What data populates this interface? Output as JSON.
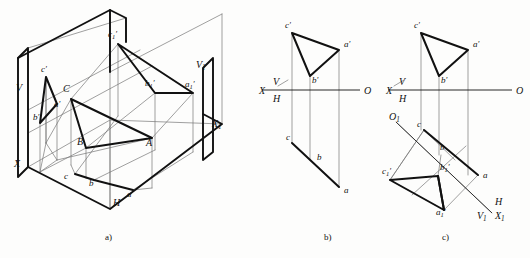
{
  "figure": {
    "background_color": "#fdfdfc",
    "ink_color": "#111111",
    "thick_line_color": "#111111",
    "thin_line_color": "#777777",
    "captions": [
      {
        "key": "a",
        "text": "a)",
        "x": 105,
        "y": 240
      },
      {
        "key": "b",
        "text": "b)",
        "x": 324,
        "y": 240
      },
      {
        "key": "c",
        "text": "c)",
        "x": 442,
        "y": 240
      }
    ]
  },
  "panel_a": {
    "name": "pictorial-3d-projection-box",
    "labels": [
      {
        "name": "label-V",
        "text": "V",
        "x": 16,
        "y": 91,
        "italic": true,
        "size": 10
      },
      {
        "name": "label-X",
        "text": "X",
        "x": 14,
        "y": 167,
        "italic": true,
        "size": 10
      },
      {
        "name": "label-H",
        "text": "H",
        "x": 113,
        "y": 206,
        "italic": true,
        "size": 10
      },
      {
        "name": "label-V1",
        "text": "V",
        "sub": "1",
        "x": 196,
        "y": 68,
        "italic": true,
        "size": 10
      },
      {
        "name": "label-X1",
        "text": "X",
        "sub": "1",
        "x": 212,
        "y": 127,
        "italic": true,
        "size": 10
      },
      {
        "name": "label-c-prime",
        "text": "c",
        "prime": true,
        "x": 41,
        "y": 72,
        "italic": true,
        "size": 9
      },
      {
        "name": "label-a-prime",
        "text": "a",
        "prime": true,
        "x": 54,
        "y": 107,
        "italic": true,
        "size": 9
      },
      {
        "name": "label-b-prime",
        "text": "b",
        "prime": true,
        "x": 33,
        "y": 120,
        "italic": true,
        "size": 9
      },
      {
        "name": "label-C",
        "text": "C",
        "x": 63,
        "y": 92,
        "italic": true,
        "size": 10
      },
      {
        "name": "label-B",
        "text": "B",
        "x": 77,
        "y": 145,
        "italic": true,
        "size": 10
      },
      {
        "name": "label-A",
        "text": "A",
        "x": 146,
        "y": 146,
        "italic": true,
        "size": 10
      },
      {
        "name": "label-c",
        "text": "c",
        "x": 64,
        "y": 179,
        "italic": true,
        "size": 9
      },
      {
        "name": "label-b",
        "text": "b",
        "x": 89,
        "y": 186,
        "italic": true,
        "size": 9
      },
      {
        "name": "label-a",
        "text": "a",
        "x": 127,
        "y": 197,
        "italic": true,
        "size": 9
      },
      {
        "name": "label-c1-prime",
        "text": "c",
        "sub": "1",
        "prime": true,
        "x": 108,
        "y": 37,
        "italic": true,
        "size": 9
      },
      {
        "name": "label-b1-prime",
        "text": "b",
        "sub": "1",
        "prime": true,
        "x": 145,
        "y": 86,
        "italic": true,
        "size": 9
      },
      {
        "name": "label-a1-prime",
        "text": "a",
        "sub": "1",
        "prime": true,
        "x": 185,
        "y": 87,
        "italic": true,
        "size": 9
      }
    ],
    "thick_paths": [
      "M 18 58 L 28 48 L 28 167 L 18 177 Z",
      "M 18 58 L 110 10 L 110 72",
      "M 110 10 L 126 18 L 126 42",
      "M 28 167 L 110 209 L 222 124 L 203 114",
      "M 203 68 L 203 160 L 213 152 L 213 58 Z"
    ],
    "thick_polylines": [
      {
        "name": "triangle-VH-projection",
        "points": "46,77 40,123 57,104 46,77"
      },
      {
        "name": "triangle-ABC-space",
        "points": "71,99 86,148 152,138 71,99"
      },
      {
        "name": "triangle-abc-horizontal",
        "points": "75,174 94,180 133,190"
      },
      {
        "name": "triangle-V1-projection",
        "points": "118,44 155,93 193,93 118,44"
      }
    ],
    "thin_lines": [
      "M 28 48 L 126 18",
      "M 28 48 L 28 167",
      "M 110 72 L 110 209",
      "M 110 72 L 222 14",
      "M 126 18 L 126 42",
      "M 222 14 L 222 124",
      "M 110 10 L 110 72",
      "M 46 77 L 46 143",
      "M 40 123 L 40 172",
      "M 57 104 L 57 160",
      "M 71 99 L 71 165",
      "M 86 148 L 86 178",
      "M 152 138 L 152 188",
      "M 118 44 L 118 116",
      "M 155 93 L 155 150",
      "M 193 93 L 193 152",
      "M 46 143 L 71 99",
      "M 40 172 L 86 148",
      "M 57 160 L 152 138",
      "M 71 165 L 75 174",
      "M 86 178 L 94 180",
      "M 152 188 L 133 190",
      "M 28 110 L 140 50",
      "M 28 133 L 152 66",
      "M 46 143 L 46 77",
      "M 75 174 L 118 116",
      "M 94 180 L 155 150",
      "M 133 190 L 193 152",
      "M 71 99 L 118 44",
      "M 86 148 L 155 93",
      "M 152 138 L 193 93",
      "M 28 167 L 110 120 L 222 124",
      "M 110 120 L 110 209",
      "M 46 143 L 40 172",
      "M 46 143 L 57 160",
      "M 40 172 L 57 160"
    ]
  },
  "panel_b": {
    "name": "two-view-orthographic-projection",
    "axis": {
      "name": "XO-ground-line",
      "x1": 262,
      "y1": 90,
      "x2": 360,
      "y2": 90
    },
    "labels": [
      {
        "name": "label-X",
        "text": "X",
        "x": 259,
        "y": 94,
        "italic": true,
        "size": 10
      },
      {
        "name": "label-V",
        "text": "V",
        "x": 273,
        "y": 85,
        "italic": true,
        "size": 10
      },
      {
        "name": "label-H",
        "text": "H",
        "x": 273,
        "y": 102,
        "italic": true,
        "size": 10
      },
      {
        "name": "label-O",
        "text": "O",
        "x": 364,
        "y": 94,
        "italic": true,
        "size": 10
      },
      {
        "name": "label-c-prime",
        "text": "c",
        "prime": true,
        "x": 285,
        "y": 28,
        "italic": true,
        "size": 9
      },
      {
        "name": "label-a-prime",
        "text": "a",
        "prime": true,
        "x": 344,
        "y": 47,
        "italic": true,
        "size": 9
      },
      {
        "name": "label-b-prime",
        "text": "b",
        "prime": true,
        "x": 312,
        "y": 83,
        "italic": true,
        "size": 9
      },
      {
        "name": "label-c",
        "text": "c",
        "x": 286,
        "y": 140,
        "italic": true,
        "size": 9
      },
      {
        "name": "label-b",
        "text": "b",
        "x": 317,
        "y": 160,
        "italic": true,
        "size": 9
      },
      {
        "name": "label-a",
        "text": "a",
        "x": 344,
        "y": 193,
        "italic": true,
        "size": 9
      }
    ],
    "points": {
      "c_prime": [
        292,
        33
      ],
      "a_prime": [
        339,
        50
      ],
      "b_prime": [
        310,
        76
      ],
      "c": [
        292,
        143
      ],
      "b": [
        310,
        160
      ],
      "a": [
        339,
        187
      ]
    },
    "thick_polylines": [
      {
        "name": "front-view-triangle",
        "points": "292,33 339,50 310,76 292,33"
      },
      {
        "name": "top-view-line-ca",
        "points": "292,143 339,187"
      }
    ],
    "thin_lines": [
      "M 292 33 L 292 143",
      "M 310 76 L 310 160",
      "M 339 50 L 339 187",
      "M 278 86 L 288 80"
    ]
  },
  "panel_c": {
    "name": "auxiliary-view-rotation",
    "axis": {
      "name": "XO-ground-line",
      "x1": 388,
      "y1": 90,
      "x2": 512,
      "y2": 90
    },
    "aux_axis": {
      "name": "X1O1-auxiliary-ground-line",
      "x1": 396,
      "y1": 122,
      "x2": 492,
      "y2": 213
    },
    "labels": [
      {
        "name": "label-X",
        "text": "X",
        "x": 386,
        "y": 94,
        "italic": true,
        "size": 10
      },
      {
        "name": "label-V",
        "text": "V",
        "x": 399,
        "y": 85,
        "italic": true,
        "size": 10
      },
      {
        "name": "label-H",
        "text": "H",
        "x": 399,
        "y": 102,
        "italic": true,
        "size": 10
      },
      {
        "name": "label-O",
        "text": "O",
        "x": 516,
        "y": 94,
        "italic": true,
        "size": 10
      },
      {
        "name": "label-O1",
        "text": "O",
        "sub": "1",
        "x": 389,
        "y": 120,
        "italic": true,
        "size": 10
      },
      {
        "name": "label-H2",
        "text": "H",
        "x": 495,
        "y": 205,
        "italic": true,
        "size": 10
      },
      {
        "name": "label-V1",
        "text": "V",
        "sub": "1",
        "x": 477,
        "y": 219,
        "italic": true,
        "size": 10
      },
      {
        "name": "label-X1",
        "text": "X",
        "sub": "1",
        "x": 495,
        "y": 219,
        "italic": true,
        "size": 10
      },
      {
        "name": "label-c-prime",
        "text": "c",
        "prime": true,
        "x": 414,
        "y": 28,
        "italic": true,
        "size": 9
      },
      {
        "name": "label-a-prime",
        "text": "a",
        "prime": true,
        "x": 473,
        "y": 47,
        "italic": true,
        "size": 9
      },
      {
        "name": "label-b-prime",
        "text": "b",
        "prime": true,
        "x": 441,
        "y": 83,
        "italic": true,
        "size": 9
      },
      {
        "name": "label-c",
        "text": "c",
        "x": 417,
        "y": 127,
        "italic": true,
        "size": 9
      },
      {
        "name": "label-b",
        "text": "b",
        "x": 440,
        "y": 150,
        "italic": true,
        "size": 9
      },
      {
        "name": "label-a",
        "text": "a",
        "x": 483,
        "y": 178,
        "italic": true,
        "size": 9
      },
      {
        "name": "label-c1-prime",
        "text": "c",
        "sub": "1",
        "prime": true,
        "x": 382,
        "y": 174,
        "italic": true,
        "size": 9
      },
      {
        "name": "label-b1-prime",
        "text": "b",
        "sub": "1",
        "prime": true,
        "x": 440,
        "y": 170,
        "italic": true,
        "size": 9
      },
      {
        "name": "label-a1-prime",
        "text": "a",
        "sub": "1",
        "prime": true,
        "x": 436,
        "y": 215,
        "italic": true,
        "size": 9
      }
    ],
    "points": {
      "c_prime": [
        421,
        33
      ],
      "a_prime": [
        468,
        50
      ],
      "b_prime": [
        439,
        76
      ],
      "c": [
        424,
        130
      ],
      "b": [
        441,
        155
      ],
      "a": [
        478,
        175
      ],
      "c1_prime": [
        390,
        180
      ],
      "b1_prime": [
        438,
        176
      ],
      "a1_prime": [
        444,
        210
      ]
    },
    "thick_polylines": [
      {
        "name": "front-view-triangle",
        "points": "421,33 468,50 439,76 421,33"
      },
      {
        "name": "top-view-line-ca",
        "points": "424,130 478,175"
      },
      {
        "name": "aux-view-triangle",
        "points": "390,180 438,176 444,210 390,180"
      },
      {
        "name": "aux-view-edge-b1a1",
        "points": "438,176 444,210"
      }
    ],
    "thin_lines": [
      "M 421 33 L 421 130",
      "M 439 76 L 439 155",
      "M 468 50 L 468 175",
      "M 396 122 L 492 213",
      "M 424 130 L 390 180",
      "M 441 155 L 438 176",
      "M 478 175 L 444 210",
      "M 424 130 L 478 175",
      "M 390 180 L 424 130",
      "M 394 86 L 404 80",
      "M 424 130 L 455 160",
      "M 412 195 L 466 146"
    ]
  }
}
